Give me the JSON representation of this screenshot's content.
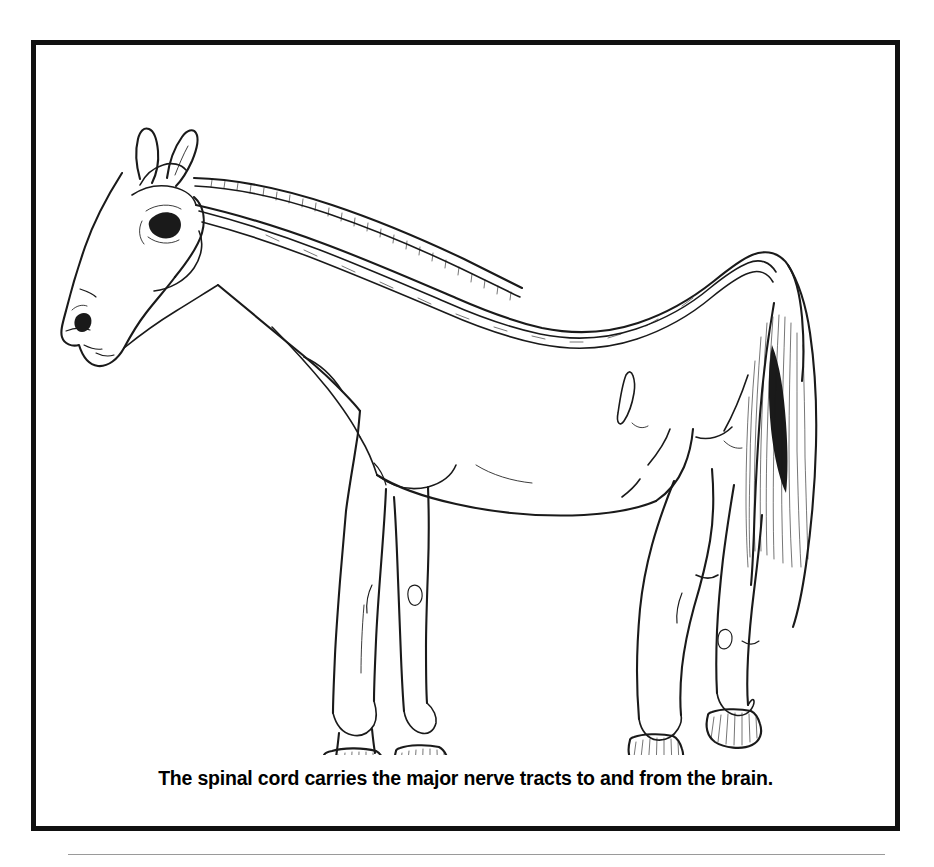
{
  "document": {
    "type": "anatomy-illustration-figure",
    "background_color": "#ffffff",
    "ink_color": "#1a1a1a"
  },
  "figure": {
    "frame": {
      "border_color": "#111111",
      "border_width_px": 5,
      "fill": "#ffffff"
    },
    "view": "left lateral profile, standing",
    "style": "black-and-white line drawing / coloring-book outline",
    "highlighted_structure": "spinal cord",
    "highlighted_structure_rendering": "narrow double-line channel running from the poll, along the crest of the neck, over the withers and back, ending at the croup",
    "anatomy_parts": [
      "ears",
      "eye",
      "nostril",
      "muzzle",
      "cheek",
      "throatlatch",
      "mane",
      "crest",
      "neck",
      "shoulder",
      "withers",
      "back",
      "barrel",
      "flank",
      "croup",
      "tail",
      "forelegs",
      "knee",
      "chestnut",
      "hind legs",
      "stifle",
      "hock",
      "fetlock",
      "pastern",
      "hooves"
    ],
    "shading_notes": [
      "mane drawn with short tick marks along the crest",
      "tail drawn with fine vertical hatching strokes",
      "hooves drawn with diagonal hatching"
    ],
    "caption": "The spinal cord carries the major nerve tracts to and from the brain."
  },
  "footer": {
    "rule_color": "#9a9a9a"
  }
}
